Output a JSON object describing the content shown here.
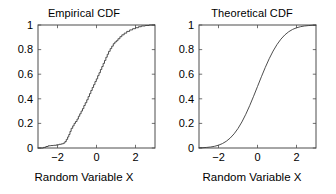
{
  "figure": {
    "background": "#ffffff",
    "axis_color": "#4d4d4d",
    "curve_color": "#3a3a3a"
  },
  "panels": [
    {
      "key": "empirical",
      "title": "Empirical CDF",
      "xlabel": "Random Variable X",
      "ylabel": "",
      "xticks": [
        "-2",
        "0",
        "2"
      ],
      "yticks": [
        "0",
        "0.2",
        "0.4",
        "0.6",
        "0.8",
        "1"
      ]
    },
    {
      "key": "theoretical",
      "title": "Theoretical CDF",
      "xlabel": "Random Variable X",
      "ylabel": "",
      "xticks": [
        "-2",
        "0",
        "2"
      ],
      "yticks": [
        "0",
        "0.2",
        "0.4",
        "0.6",
        "0.8",
        "1"
      ]
    }
  ],
  "chart_data": [
    {
      "type": "line",
      "title": "Empirical CDF",
      "xlabel": "Random Variable X",
      "ylabel": "",
      "xlim": [
        -3,
        3
      ],
      "ylim": [
        0,
        1
      ],
      "xticks": [
        -2,
        0,
        2
      ],
      "yticks": [
        0,
        0.2,
        0.4,
        0.6,
        0.8,
        1
      ],
      "grid": false,
      "legend": null,
      "style": "staircase",
      "series": [
        {
          "name": "Empirical CDF",
          "x": [
            -3.0,
            -2.72,
            -2.6,
            -2.48,
            -2.35,
            -2.2,
            -2.05,
            -1.92,
            -1.8,
            -1.7,
            -1.62,
            -1.55,
            -1.48,
            -1.42,
            -1.36,
            -1.3,
            -1.22,
            -1.15,
            -1.08,
            -1.0,
            -0.93,
            -0.86,
            -0.79,
            -0.72,
            -0.65,
            -0.58,
            -0.5,
            -0.43,
            -0.36,
            -0.29,
            -0.22,
            -0.15,
            -0.08,
            -0.01,
            0.06,
            0.13,
            0.2,
            0.27,
            0.34,
            0.41,
            0.48,
            0.55,
            0.62,
            0.7,
            0.78,
            0.86,
            0.94,
            1.02,
            1.1,
            1.2,
            1.3,
            1.42,
            1.55,
            1.7,
            1.85,
            2.0,
            2.15,
            2.3,
            2.5,
            2.7,
            3.0
          ],
          "y": [
            0.0,
            0.005,
            0.012,
            0.018,
            0.02,
            0.022,
            0.026,
            0.03,
            0.034,
            0.04,
            0.052,
            0.07,
            0.09,
            0.11,
            0.135,
            0.16,
            0.18,
            0.2,
            0.215,
            0.235,
            0.258,
            0.278,
            0.3,
            0.32,
            0.345,
            0.368,
            0.392,
            0.418,
            0.442,
            0.468,
            0.492,
            0.515,
            0.54,
            0.562,
            0.588,
            0.612,
            0.638,
            0.662,
            0.688,
            0.712,
            0.738,
            0.762,
            0.786,
            0.808,
            0.828,
            0.848,
            0.862,
            0.872,
            0.888,
            0.905,
            0.92,
            0.934,
            0.948,
            0.96,
            0.97,
            0.978,
            0.986,
            0.992,
            0.996,
            1.0,
            1.0
          ]
        }
      ]
    },
    {
      "type": "line",
      "title": "Theoretical CDF",
      "xlabel": "Random Variable X",
      "ylabel": "",
      "xlim": [
        -3,
        3
      ],
      "ylim": [
        0,
        1
      ],
      "xticks": [
        -2,
        0,
        2
      ],
      "yticks": [
        0,
        0.2,
        0.4,
        0.6,
        0.8,
        1
      ],
      "grid": false,
      "legend": null,
      "style": "smooth",
      "distribution": "standard normal CDF (mu=0, sigma=1)",
      "series": [
        {
          "name": "Theoretical CDF",
          "x": [
            -3.0,
            -2.8,
            -2.6,
            -2.4,
            -2.2,
            -2.0,
            -1.8,
            -1.6,
            -1.4,
            -1.2,
            -1.0,
            -0.8,
            -0.6,
            -0.4,
            -0.2,
            0.0,
            0.2,
            0.4,
            0.6,
            0.8,
            1.0,
            1.2,
            1.4,
            1.6,
            1.8,
            2.0,
            2.2,
            2.4,
            2.6,
            2.8,
            3.0
          ],
          "y": [
            0.0013,
            0.0026,
            0.0047,
            0.0082,
            0.0139,
            0.0228,
            0.0359,
            0.0548,
            0.0808,
            0.1151,
            0.1587,
            0.2119,
            0.2743,
            0.3446,
            0.4207,
            0.5,
            0.5793,
            0.6554,
            0.7257,
            0.7881,
            0.8413,
            0.8849,
            0.9192,
            0.9452,
            0.9641,
            0.9772,
            0.9861,
            0.9918,
            0.9953,
            0.9974,
            0.9987
          ]
        }
      ]
    }
  ]
}
